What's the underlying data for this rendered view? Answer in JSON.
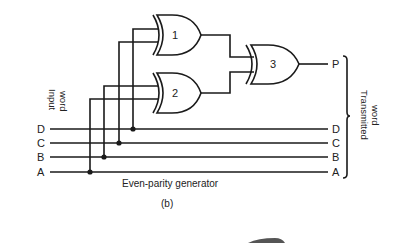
{
  "title": "Even-parity generator",
  "subfigure": "(b)",
  "input_label": [
    "Input",
    "word"
  ],
  "output_label": [
    "Transmitted",
    "word"
  ],
  "inputs": [
    {
      "name": "D",
      "y": 129,
      "tap_x": 133,
      "top_y": 29
    },
    {
      "name": "C",
      "y": 143,
      "tap_x": 119,
      "top_y": 42
    },
    {
      "name": "B",
      "y": 157,
      "tap_x": 104,
      "top_y": 86
    },
    {
      "name": "A",
      "y": 172,
      "tap_x": 90,
      "top_y": 99
    }
  ],
  "gates": [
    {
      "id": "1",
      "type": "XOR",
      "label": "1"
    },
    {
      "id": "2",
      "type": "XOR",
      "label": "2"
    },
    {
      "id": "3",
      "type": "XOR",
      "label": "3"
    }
  ],
  "output": {
    "name": "P"
  },
  "outputs_right": [
    "P",
    "D",
    "C",
    "B",
    "A"
  ],
  "colors": {
    "line": "#1a1a1a",
    "text": "#222222",
    "background": "#ffffff"
  }
}
